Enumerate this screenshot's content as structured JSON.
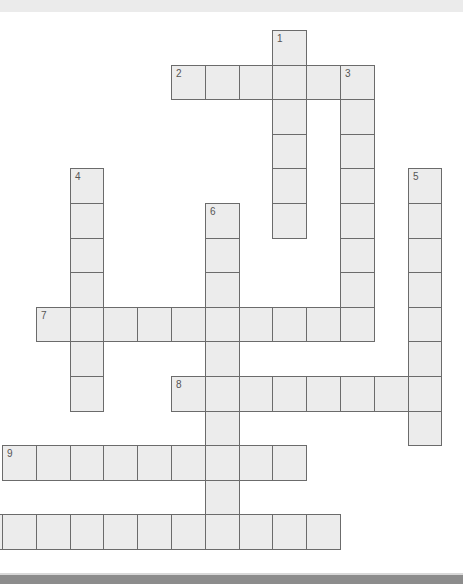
{
  "puzzle": {
    "title": "Crossword",
    "words": [
      {
        "number": "1",
        "direction": "down",
        "row": 0,
        "col": 8,
        "length": 6
      },
      {
        "number": "2",
        "direction": "across",
        "row": 1,
        "col": 5,
        "length": 6
      },
      {
        "number": "3",
        "direction": "down",
        "row": 1,
        "col": 10,
        "length": 8
      },
      {
        "number": "4",
        "direction": "down",
        "row": 4,
        "col": 2,
        "length": 7
      },
      {
        "number": "5",
        "direction": "down",
        "row": 4,
        "col": 12,
        "length": 8
      },
      {
        "number": "6",
        "direction": "down",
        "row": 5,
        "col": 6,
        "length": 10
      },
      {
        "number": "7",
        "direction": "across",
        "row": 8,
        "col": 1,
        "length": 10
      },
      {
        "number": "8",
        "direction": "across",
        "row": 10,
        "col": 5,
        "length": 8
      },
      {
        "number": "9",
        "direction": "across",
        "row": 12,
        "col": 0,
        "length": 9
      },
      {
        "number": "",
        "direction": "across",
        "row": 14,
        "col": -1,
        "length": 11
      }
    ]
  }
}
